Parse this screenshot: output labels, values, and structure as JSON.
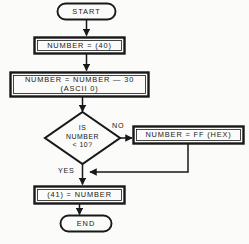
{
  "diagram": {
    "type": "flowchart",
    "colors": {
      "stroke": "#17181a",
      "text": "#17181a",
      "background": "#fbfbf9"
    },
    "nodes": {
      "start": {
        "label": "START",
        "shape": "terminator"
      },
      "assign_number": {
        "label": "NUMBER = (40)",
        "shape": "process"
      },
      "subtract": {
        "line1": "NUMBER = NUMBER — 30",
        "line2": "(ASCII 0)",
        "shape": "process"
      },
      "decision": {
        "line1": "IS",
        "line2": "NUMBER",
        "line3": "< 10?",
        "shape": "decision"
      },
      "set_ff": {
        "label": "NUMBER = FF (HEX)",
        "shape": "process"
      },
      "store": {
        "label": "(41) = NUMBER",
        "shape": "process"
      },
      "end": {
        "label": "END",
        "shape": "terminator"
      }
    },
    "edge_labels": {
      "no": "NO",
      "yes": "YES"
    }
  }
}
